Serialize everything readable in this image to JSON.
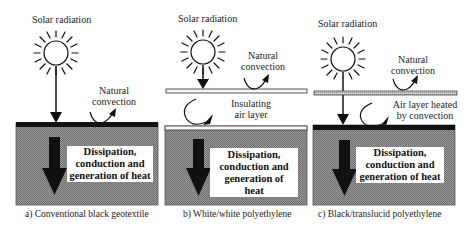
{
  "panels": [
    {
      "id": "a",
      "solar_label": "Solar radiation",
      "convection_label_1": "Natural",
      "convection_label_2": "convection",
      "box_label": [
        "Dissipation,",
        "conduction and",
        "generation of heat"
      ],
      "caption": "a) Conventional black geotextile"
    },
    {
      "id": "b",
      "solar_label": "Solar radiation",
      "convection_label_1": "Natural",
      "convection_label_2": "convection",
      "air_label_1": "Insulating",
      "air_label_2": "air layer",
      "box_label": [
        "Dissipation,",
        "conduction and",
        "generation of",
        "heat"
      ],
      "caption": "b) White/white polyethylene"
    },
    {
      "id": "c",
      "solar_label": "Solar radiation",
      "convection_label_1": "Natural",
      "convection_label_2": "convection",
      "air_label_1": "Air layer heated",
      "air_label_2": "by convection",
      "box_label": [
        "Dissipation,",
        "conduction and",
        "generation of heat"
      ],
      "caption": "c) Black/translucid polyethylene"
    }
  ],
  "colors": {
    "soil": "#8a8a8a",
    "black_cover": "#111111",
    "white_film": "#f4f4f4",
    "translucent_film": "#b5b5b5"
  }
}
